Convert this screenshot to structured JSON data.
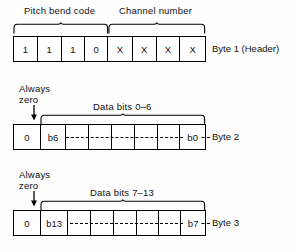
{
  "figure": {
    "line_color": "#000000",
    "text_color": "#101010",
    "background": "#ffffff"
  },
  "rows": [
    {
      "id": "byte1",
      "side_label": "Byte 1 (Header)",
      "group_captions": [
        {
          "text": "Pitch bend code"
        },
        {
          "text": "Channel number"
        }
      ],
      "cells": [
        {
          "value": "1"
        },
        {
          "value": "1"
        },
        {
          "value": "1"
        },
        {
          "value": "0"
        },
        {
          "value": "X"
        },
        {
          "value": "X"
        },
        {
          "value": "X"
        },
        {
          "value": "X"
        }
      ]
    },
    {
      "id": "byte2",
      "side_label": "Byte 2",
      "zero_label_line1": "Always",
      "zero_label_line2": "zero",
      "group_captions": [
        {
          "text": "Data bits 0–6"
        }
      ],
      "cells": [
        {
          "value": "0"
        },
        {
          "value": "b6"
        },
        {
          "value": ""
        },
        {
          "value": ""
        },
        {
          "value": ""
        },
        {
          "value": ""
        },
        {
          "value": ""
        },
        {
          "value": "b0"
        }
      ]
    },
    {
      "id": "byte3",
      "side_label": "Byte 3",
      "zero_label_line1": "Always",
      "zero_label_line2": "zero",
      "group_captions": [
        {
          "text": "Data bits 7–13"
        }
      ],
      "cells": [
        {
          "value": "0"
        },
        {
          "value": "b13"
        },
        {
          "value": ""
        },
        {
          "value": ""
        },
        {
          "value": ""
        },
        {
          "value": ""
        },
        {
          "value": ""
        },
        {
          "value": "b7"
        }
      ]
    }
  ]
}
